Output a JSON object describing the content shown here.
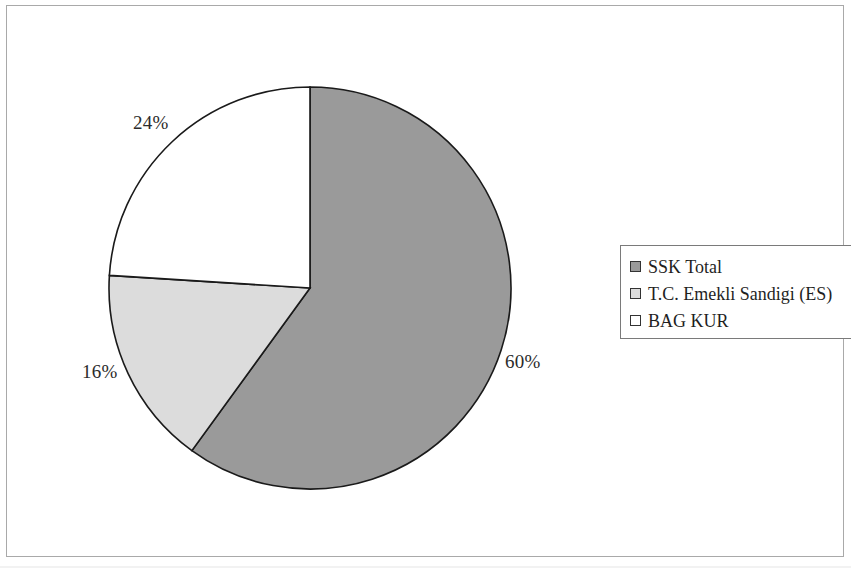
{
  "chart_data": {
    "type": "pie",
    "title": "",
    "subtitle": "",
    "xlabel": "",
    "ylabel": "",
    "grid": false,
    "legend_position": "right",
    "start_angle_deg": 0,
    "direction": "clockwise",
    "categories": [
      "SSK Total",
      "T.C. Emekli Sandigi (ES)",
      "BAG KUR"
    ],
    "values": [
      60,
      16,
      24
    ],
    "unit": "%",
    "data_labels": [
      "60%",
      "16%",
      "24%"
    ],
    "colors": [
      "#9a9a9a",
      "#dcdcdc",
      "#ffffff"
    ],
    "slice_border_color": "#1a1a1a",
    "slices": [
      {
        "name": "SSK Total",
        "value": 60,
        "label": "60%",
        "color": "#9a9a9a",
        "start_deg": 0,
        "end_deg": 216
      },
      {
        "name": "T.C. Emekli Sandigi (ES)",
        "value": 16,
        "label": "16%",
        "color": "#dcdcdc",
        "start_deg": 216,
        "end_deg": 273.6
      },
      {
        "name": "BAG KUR",
        "value": 24,
        "label": "24%",
        "color": "#ffffff",
        "start_deg": 273.6,
        "end_deg": 360
      }
    ]
  },
  "legend": {
    "items": [
      {
        "label": "SSK Total",
        "color": "#9a9a9a"
      },
      {
        "label": "T.C. Emekli Sandigi (ES)",
        "color": "#dcdcdc"
      },
      {
        "label": "BAG KUR",
        "color": "#ffffff"
      }
    ]
  },
  "labels": {
    "ssk": "60%",
    "es": "16%",
    "bagkur": "24%"
  }
}
